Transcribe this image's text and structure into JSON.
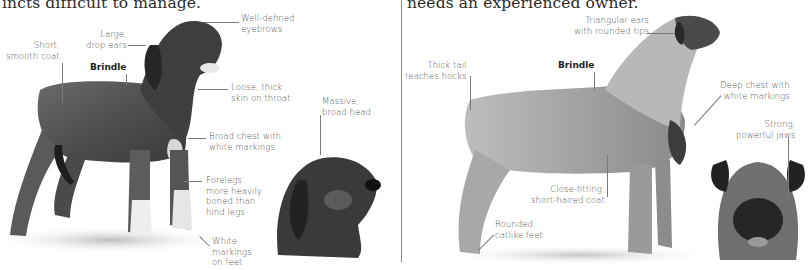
{
  "left_panel": {
    "intro_fragment": "incts difficult to manage.",
    "labels": {
      "eyebrows": "Well-defined\neyebrows",
      "ears": "Large,\ndrop ears",
      "coat": "Short,\nsmooth coat",
      "color": "Brindle",
      "throat": "Loose, thick\nskin on throat",
      "head": "Massive,\nbroad head",
      "chest": "Broad chest with\nwhite markings",
      "forelegs": "Forelegs\nmore heavily\nboned than\nhind legs",
      "feet": "White\nmarkings\non feet"
    }
  },
  "right_panel": {
    "intro_fragment": "needs an experienced owner.",
    "labels": {
      "ears": "Triangular ears\nwith rounded tips",
      "tail": "Thick tail\nreaches hocks",
      "color": "Brindle",
      "chest": "Deep chest with\nwhite markings",
      "jaws": "Strong,\npowerful jaws",
      "coat": "Close-fitting,\nshort-haired coat",
      "feet": "Rounded,\ncatlike feet"
    }
  },
  "colors": {
    "text": "#555555",
    "heading": "#2a2a2a",
    "leader": "#7a7a7a",
    "divider": "#8a8a8a"
  }
}
